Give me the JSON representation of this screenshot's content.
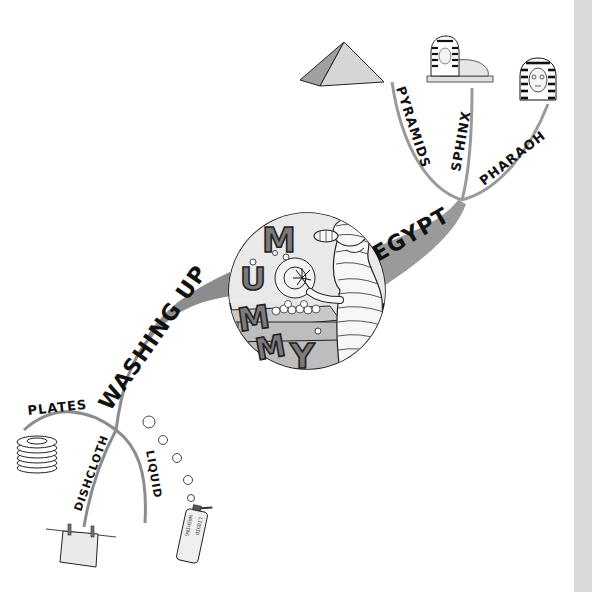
{
  "mind_map": {
    "central": {
      "title": "MUMMY",
      "letters": [
        "M",
        "U",
        "M",
        "M",
        "Y"
      ],
      "image": "mummy-washing-dishes"
    },
    "branches": [
      {
        "label": "EGYPT",
        "children": [
          {
            "label": "PYRAMIDS",
            "image": "pyramid"
          },
          {
            "label": "SPHINX",
            "image": "sphinx"
          },
          {
            "label": "PHARAOH",
            "image": "pharaoh-head"
          }
        ]
      },
      {
        "label": "WASHING UP",
        "children": [
          {
            "label": "PLATES",
            "image": "stack-of-plates"
          },
          {
            "label": "DISHCLOTH",
            "image": "cloth-on-line"
          },
          {
            "label": "LIQUID",
            "image": "washing-liquid-bottle"
          }
        ]
      }
    ],
    "bottle_text": {
      "left": "WASHING",
      "right": "LIQUID"
    }
  },
  "colors": {
    "branch": "#8c8c8c",
    "branch_thick": "#9a9a9a",
    "outline": "#1a1a1a",
    "fill_light": "#e6e6e6",
    "fill_mid": "#bdbdbd",
    "fill_dark": "#7b7b7b",
    "side_strip": "#d9d9d9"
  }
}
